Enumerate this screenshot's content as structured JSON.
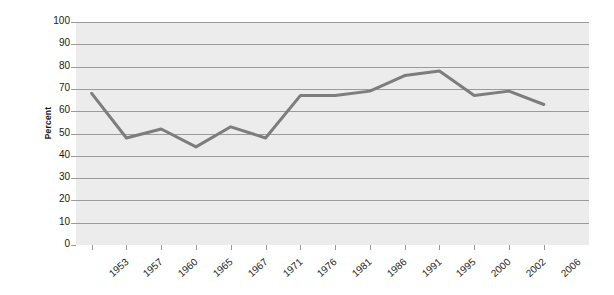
{
  "chart_data": {
    "type": "line",
    "title": "",
    "xlabel": "",
    "ylabel": "Percent",
    "categories": [
      "1953",
      "1957",
      "1960",
      "1965",
      "1967",
      "1971",
      "1976",
      "1981",
      "1986",
      "1991",
      "1995",
      "2000",
      "2002",
      "2006"
    ],
    "values": [
      68,
      48,
      52,
      44,
      53,
      48,
      67,
      67,
      69,
      76,
      78,
      67,
      69,
      63
    ],
    "series": [
      {
        "name": "Percent",
        "values": [
          68,
          48,
          52,
          44,
          53,
          48,
          67,
          67,
          69,
          76,
          78,
          67,
          69,
          63
        ]
      }
    ],
    "ylim": [
      0,
      100
    ],
    "ytick_labels": [
      "0",
      "10",
      "20",
      "30",
      "40",
      "50",
      "60",
      "70",
      "80",
      "90",
      "100"
    ],
    "ytick_values": [
      0,
      10,
      20,
      30,
      40,
      50,
      60,
      70,
      80,
      90,
      100
    ],
    "grid": true,
    "legend": "none",
    "colors": {
      "line": "#7d7d7d",
      "plot_background": "#ececec",
      "gridline": "#9b9b9b",
      "axis": "#9a9a9a",
      "text": "#1a1a1a",
      "page_background": "#ffffff"
    }
  }
}
